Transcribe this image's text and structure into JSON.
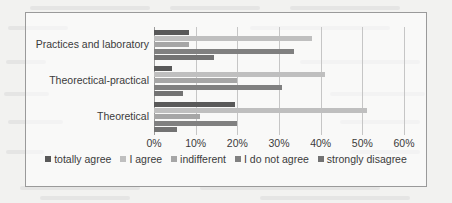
{
  "chart_data": {
    "type": "bar",
    "orientation": "horizontal",
    "title": "",
    "xlabel": "",
    "ylabel": "",
    "xlim": [
      0,
      60
    ],
    "xticks": [
      "0%",
      "10%",
      "20%",
      "30%",
      "40%",
      "50%",
      "60%"
    ],
    "xtick_values": [
      0,
      10,
      20,
      30,
      40,
      50,
      60
    ],
    "grid": true,
    "legend_position": "bottom",
    "categories": [
      "Practices and laboratory",
      "Theorectical-practical",
      "Theoretical"
    ],
    "series": [
      {
        "name": "totally agree",
        "color": "#595959",
        "values": [
          8.5,
          4.4,
          19.5
        ]
      },
      {
        "name": "I agree",
        "color": "#bfbfbf",
        "values": [
          38.0,
          41.0,
          51.0
        ]
      },
      {
        "name": "indifferent",
        "color": "#a6a6a6",
        "values": [
          8.5,
          20.0,
          11.0
        ]
      },
      {
        "name": "I do not agree",
        "color": "#808080",
        "values": [
          33.5,
          30.8,
          20.0
        ]
      },
      {
        "name": "strongly disagree",
        "color": "#737373",
        "values": [
          14.5,
          7.0,
          5.5
        ]
      }
    ]
  },
  "figure": {
    "plot_bg": "#ffffff",
    "grid_color": "#c6c6c6",
    "axis_color": "#9c9c9c",
    "text_color": "#3b3b3b",
    "border_color": "#9a9a9a",
    "page_bg": "#f2f2f0"
  }
}
